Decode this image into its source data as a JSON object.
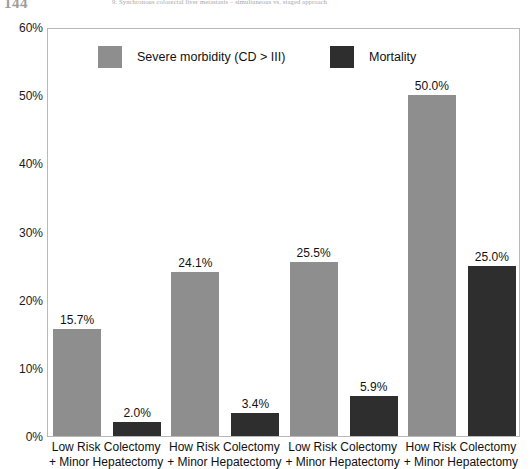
{
  "page_header": {
    "page_number": "144",
    "running_head": "9. Synchronous colorectal liver metastasis – simultaneous vs. staged approach"
  },
  "legend": {
    "entries": [
      {
        "label": "Severe morbidity (CD > III)",
        "color": "#8e8e8e"
      },
      {
        "label": "Mortality",
        "color": "#2e2e2e"
      }
    ]
  },
  "axis": {
    "y_ticks": [
      "0%",
      "10%",
      "20%",
      "30%",
      "40%",
      "50%",
      "60%"
    ]
  },
  "chart_data": {
    "type": "bar",
    "title": "",
    "subtitle": "",
    "xlabel": "",
    "ylabel": "",
    "ylim": [
      0,
      60
    ],
    "y_tick_step": 10,
    "y_tick_format": "percent",
    "grid": false,
    "legend_position": "top-inside",
    "categories": [
      "Low Risk Colectomy + Minor Hepatectomy",
      "How Risk Colectomy + Minor Hepatectomy",
      "Low Risk Colectomy + Minor Hepatectomy",
      "How Risk Colectomy + Minor Hepatectomy"
    ],
    "category_lines": [
      [
        "Low Risk Colectomy",
        "+ Minor Hepatectomy"
      ],
      [
        "How Risk Colectomy",
        "+ Minor Hepatectomy"
      ],
      [
        "Low Risk Colectomy",
        "+ Minor Hepatectomy"
      ],
      [
        "How Risk Colectomy",
        "+ Minor Hepatectomy"
      ]
    ],
    "series": [
      {
        "name": "Severe morbidity (CD > III)",
        "color": "#8e8e8e",
        "values": [
          15.7,
          24.1,
          25.5,
          50.0
        ],
        "labels": [
          "15.7%",
          "24.1%",
          "25.5%",
          "50.0%"
        ]
      },
      {
        "name": "Mortality",
        "color": "#2e2e2e",
        "values": [
          2.0,
          3.4,
          5.9,
          25.0
        ],
        "labels": [
          "2.0%",
          "3.4%",
          "5.9%",
          "25.0%"
        ]
      }
    ]
  }
}
